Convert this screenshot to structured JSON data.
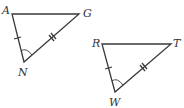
{
  "figure": {
    "stroke_color": "#3a3a3a",
    "triangles": [
      {
        "name": "triangle-AGN",
        "vertices": [
          {
            "label": "A",
            "x": 12,
            "y": 14,
            "lx": 2,
            "ly": 14
          },
          {
            "label": "G",
            "x": 79,
            "y": 14,
            "lx": 83,
            "ly": 14
          },
          {
            "label": "N",
            "x": 24,
            "y": 62,
            "lx": 19,
            "ly": 76
          }
        ],
        "marks": {
          "AN": "single tick",
          "NG": "double tick",
          "angle_N": "arc"
        }
      },
      {
        "name": "triangle-RTW",
        "vertices": [
          {
            "label": "R",
            "x": 102,
            "y": 44,
            "lx": 92,
            "ly": 44
          },
          {
            "label": "T",
            "x": 171,
            "y": 44,
            "lx": 173,
            "ly": 44
          },
          {
            "label": "W",
            "x": 115,
            "y": 92,
            "lx": 109,
            "ly": 106
          }
        ],
        "marks": {
          "RW": "single tick",
          "WT": "double tick",
          "angle_W": "arc"
        }
      }
    ]
  }
}
